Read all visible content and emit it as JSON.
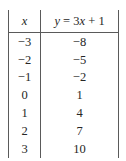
{
  "table": {
    "headers": {
      "x_label": "x",
      "y_label": "y = 3x + 1",
      "y_label_parts": {
        "var_y": "y",
        "equals": "=",
        "coefficient": "3",
        "var_x": "x",
        "plus": "+",
        "constant": "1"
      }
    },
    "rows": [
      {
        "x": "−3",
        "y": "−8"
      },
      {
        "x": "−2",
        "y": "−5"
      },
      {
        "x": "−1",
        "y": "−2"
      },
      {
        "x": "0",
        "y": "1"
      },
      {
        "x": "1",
        "y": "4"
      },
      {
        "x": "2",
        "y": "7"
      },
      {
        "x": "3",
        "y": "10"
      }
    ]
  },
  "colors": {
    "background": "#ffffff",
    "text": "#262626",
    "rule": "#5a5a5a"
  }
}
